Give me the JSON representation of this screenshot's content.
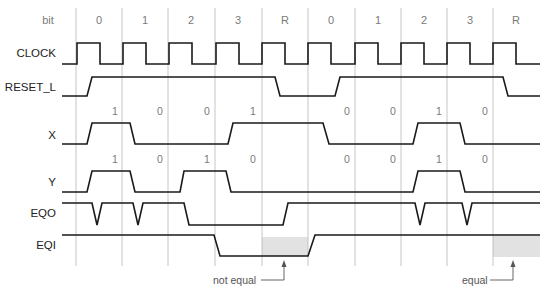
{
  "diagram": {
    "type": "timing-diagram",
    "header_label": "bit",
    "bit_columns": [
      "0",
      "1",
      "2",
      "3",
      "R",
      "0",
      "1",
      "2",
      "3",
      "R"
    ],
    "signals": [
      {
        "name": "CLOCK"
      },
      {
        "name": "RESET_L"
      },
      {
        "name": "X",
        "values": [
          "1",
          "0",
          "0",
          "1",
          "0",
          "0",
          "1",
          "0"
        ]
      },
      {
        "name": "Y",
        "values": [
          "1",
          "0",
          "1",
          "0",
          "0",
          "0",
          "1",
          "0"
        ]
      },
      {
        "name": "EQO"
      },
      {
        "name": "EQI"
      }
    ],
    "annotations": {
      "not_equal": "not equal",
      "equal": "equal"
    },
    "colors": {
      "waveform": "#1a1a1a",
      "gridline": "#b8b8b8",
      "shade": "#e2e2e2",
      "label_gray": "#7a7a7a"
    }
  }
}
